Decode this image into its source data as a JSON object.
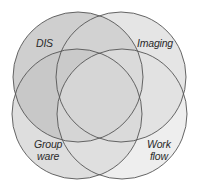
{
  "diagram": {
    "type": "venn",
    "sets": [
      {
        "id": "dis",
        "label": "DIS",
        "label_lines": [
          "DIS"
        ],
        "fill": "#b8b8b8"
      },
      {
        "id": "imaging",
        "label": "Imaging",
        "label_lines": [
          "Imaging"
        ],
        "fill": "#d9d9d9"
      },
      {
        "id": "groupware",
        "label": "Groupware",
        "label_lines": [
          "Group",
          "ware"
        ],
        "fill": "#cdcdcd"
      },
      {
        "id": "workflow",
        "label": "Workflow",
        "label_lines": [
          "Work",
          "flow"
        ],
        "fill": "#e2e2e2"
      }
    ],
    "stroke_color": "#555555",
    "background": "#ffffff"
  }
}
